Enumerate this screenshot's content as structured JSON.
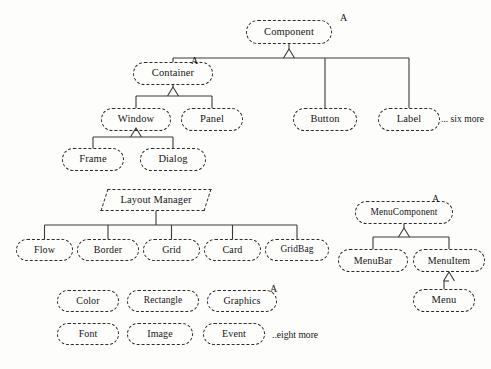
{
  "diagram": {
    "style": {
      "background": "#fdfdfb",
      "node_border_color": "#2b2b2b",
      "edge_color": "#3a3a3a",
      "text_color": "#161616",
      "node_border_style": "dashed"
    },
    "nodes": [
      {
        "id": "component",
        "label": "Component",
        "x": 246,
        "y": 20,
        "w": 86,
        "h": 24,
        "shape": "rounded",
        "abstract_marker": "A"
      },
      {
        "id": "container",
        "label": "Container",
        "x": 133,
        "y": 62,
        "w": 80,
        "h": 23,
        "shape": "rounded",
        "abstract_marker": "A"
      },
      {
        "id": "button",
        "label": "Button",
        "x": 293,
        "y": 108,
        "w": 64,
        "h": 23,
        "shape": "rounded",
        "abstract_marker": ""
      },
      {
        "id": "label",
        "label": "Label",
        "x": 378,
        "y": 108,
        "w": 62,
        "h": 23,
        "shape": "rounded",
        "abstract_marker": ""
      },
      {
        "id": "window",
        "label": "Window",
        "x": 101,
        "y": 108,
        "w": 70,
        "h": 23,
        "shape": "rounded",
        "abstract_marker": ""
      },
      {
        "id": "panel",
        "label": "Panel",
        "x": 181,
        "y": 108,
        "w": 62,
        "h": 23,
        "shape": "rounded",
        "abstract_marker": ""
      },
      {
        "id": "frame",
        "label": "Frame",
        "x": 62,
        "y": 148,
        "w": 62,
        "h": 23,
        "shape": "rounded",
        "abstract_marker": ""
      },
      {
        "id": "dialog",
        "label": "Dialog",
        "x": 140,
        "y": 148,
        "w": 66,
        "h": 23,
        "shape": "rounded",
        "abstract_marker": ""
      },
      {
        "id": "layoutmanager",
        "label": "Layout Manager",
        "x": 104,
        "y": 189,
        "w": 104,
        "h": 22,
        "shape": "parallelogram",
        "abstract_marker": ""
      },
      {
        "id": "flow",
        "label": "Flow",
        "x": 16,
        "y": 239,
        "w": 57,
        "h": 22,
        "shape": "rounded",
        "abstract_marker": ""
      },
      {
        "id": "border",
        "label": "Border",
        "x": 77,
        "y": 239,
        "w": 62,
        "h": 22,
        "shape": "rounded",
        "abstract_marker": ""
      },
      {
        "id": "grid",
        "label": "Grid",
        "x": 143,
        "y": 239,
        "w": 57,
        "h": 22,
        "shape": "rounded",
        "abstract_marker": ""
      },
      {
        "id": "card",
        "label": "Card",
        "x": 204,
        "y": 239,
        "w": 57,
        "h": 22,
        "shape": "rounded",
        "abstract_marker": ""
      },
      {
        "id": "gridbag",
        "label": "GridBag",
        "x": 265,
        "y": 239,
        "w": 64,
        "h": 22,
        "shape": "rounded",
        "abstract_marker": ""
      },
      {
        "id": "menucomponent",
        "label": "MenuComponent",
        "x": 355,
        "y": 201,
        "w": 98,
        "h": 23,
        "shape": "rounded",
        "abstract_marker": "A"
      },
      {
        "id": "menubar",
        "label": "MenuBar",
        "x": 338,
        "y": 249,
        "w": 70,
        "h": 23,
        "shape": "rounded",
        "abstract_marker": ""
      },
      {
        "id": "menuitem",
        "label": "MenuItem",
        "x": 413,
        "y": 249,
        "w": 72,
        "h": 23,
        "shape": "rounded",
        "abstract_marker": ""
      },
      {
        "id": "menu",
        "label": "Menu",
        "x": 413,
        "y": 289,
        "w": 62,
        "h": 23,
        "shape": "rounded",
        "abstract_marker": ""
      },
      {
        "id": "color",
        "label": "Color",
        "x": 57,
        "y": 290,
        "w": 62,
        "h": 22,
        "shape": "rounded",
        "abstract_marker": ""
      },
      {
        "id": "rectangle",
        "label": "Rectangle",
        "x": 127,
        "y": 290,
        "w": 72,
        "h": 22,
        "shape": "rounded",
        "abstract_marker": ""
      },
      {
        "id": "graphics",
        "label": "Graphics",
        "x": 207,
        "y": 290,
        "w": 70,
        "h": 22,
        "shape": "rounded",
        "abstract_marker": "A"
      },
      {
        "id": "font",
        "label": "Font",
        "x": 57,
        "y": 323,
        "w": 62,
        "h": 22,
        "shape": "rounded",
        "abstract_marker": ""
      },
      {
        "id": "image",
        "label": "Image",
        "x": 127,
        "y": 323,
        "w": 66,
        "h": 22,
        "shape": "rounded",
        "abstract_marker": ""
      },
      {
        "id": "event",
        "label": "Event",
        "x": 203,
        "y": 323,
        "w": 62,
        "h": 22,
        "shape": "rounded",
        "abstract_marker": ""
      }
    ],
    "annotations": [
      {
        "id": "ann-component",
        "text": "A",
        "x": 340,
        "y": 12
      },
      {
        "id": "ann-container",
        "text": "A",
        "x": 191,
        "y": 55
      },
      {
        "id": "ann-menucomponent",
        "text": "A",
        "x": 432,
        "y": 193
      },
      {
        "id": "ann-graphics",
        "text": "A",
        "x": 270,
        "y": 283
      }
    ],
    "ellipsis_notes": [
      {
        "id": "note-six-more",
        "text": "... six more",
        "x": 441,
        "y": 113
      },
      {
        "id": "note-eight-more",
        "text": "..eight more",
        "x": 272,
        "y": 329
      }
    ],
    "edges": [
      {
        "from": "component",
        "to": [
          "container",
          "button",
          "label"
        ],
        "type": "generalization",
        "bus_y": 58
      },
      {
        "from": "container",
        "to": [
          "window",
          "panel"
        ],
        "type": "generalization",
        "bus_y": 96
      },
      {
        "from": "window",
        "to": [
          "frame",
          "dialog"
        ],
        "type": "generalization",
        "bus_y": 137
      },
      {
        "from": "layoutmanager",
        "to": [
          "flow",
          "border",
          "grid",
          "card",
          "gridbag"
        ],
        "type": "plain",
        "bus_y": 225
      },
      {
        "from": "menucomponent",
        "to": [
          "menubar",
          "menuitem"
        ],
        "type": "generalization",
        "bus_y": 237
      },
      {
        "from": "menuitem",
        "to": [
          "menu"
        ],
        "type": "generalization",
        "bus_y": 281
      }
    ]
  }
}
